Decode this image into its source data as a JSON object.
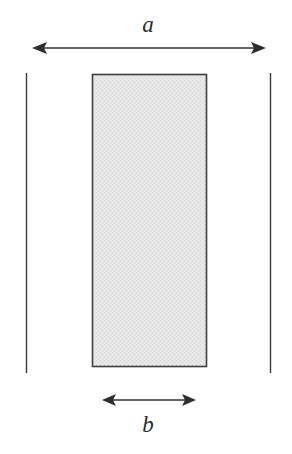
{
  "diagram": {
    "background_color": "#ffffff",
    "line_color": "#333333",
    "labels": {
      "width_outer": "a",
      "width_inner": "b"
    },
    "shape": {
      "name": "shaded-rectangle",
      "fill_color": "#e3e3e3",
      "stroke_color": "#404040",
      "x": 92,
      "y": 74,
      "width": 115,
      "height": 293
    },
    "dimensions": [
      {
        "id": "dimension-a",
        "label": "a",
        "orientation": "horizontal",
        "arrow_style": "double-headed",
        "x1": 32,
        "x2": 266,
        "y": 48,
        "label_x": 148,
        "label_y": 25
      },
      {
        "id": "dimension-b",
        "label": "b",
        "orientation": "horizontal",
        "arrow_style": "double-headed",
        "x1": 102,
        "x2": 196,
        "y": 400,
        "label_x": 148,
        "label_y": 428
      }
    ],
    "extension_lines": [
      {
        "id": "extension-line-left",
        "x": 26.5,
        "y1": 73,
        "y2": 373
      },
      {
        "id": "extension-line-right",
        "x": 270.5,
        "y1": 73,
        "y2": 373
      }
    ]
  }
}
